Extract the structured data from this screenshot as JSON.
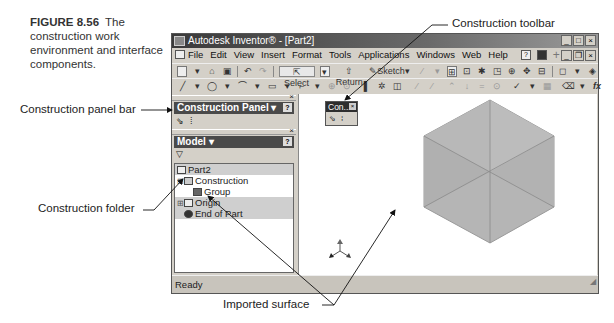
{
  "figure": {
    "number": "FIGURE 8.56",
    "caption": "The construction work environment and interface components."
  },
  "callouts": {
    "construction_toolbar": "Construction toolbar",
    "construction_panel_bar": "Construction panel bar",
    "construction_folder": "Construction folder",
    "imported_surface": "Imported surface"
  },
  "window": {
    "title": "Autodesk Inventor® - [Part2]",
    "controls": [
      "_",
      "□",
      "×"
    ],
    "doc_controls": [
      "_",
      "❐",
      "×"
    ]
  },
  "menu": {
    "items": [
      "File",
      "Edit",
      "View",
      "Insert",
      "Format",
      "Tools",
      "Applications",
      "Windows",
      "Web",
      "Help"
    ],
    "icons": [
      "help-icon",
      "camera-icon",
      "plus-icon"
    ]
  },
  "toolbar1": {
    "select_label": "Select",
    "return_label": "Return",
    "sketch_label": "Sketch"
  },
  "toolbar2": {
    "fx_label": "fx"
  },
  "construction_panel": {
    "title": "Construction Panel ▾",
    "help": "?"
  },
  "model_panel": {
    "title": "Model ▾",
    "help": "?",
    "filter_icon": "▽",
    "tree": [
      {
        "label": "Part2",
        "indent": 0,
        "shaded": true,
        "icon": "part-icon"
      },
      {
        "label": "Construction",
        "indent": 1,
        "shaded": false,
        "icon": "folder-icon",
        "expander": "⊟"
      },
      {
        "label": "Group",
        "indent": 2,
        "shaded": false,
        "icon": "group-icon"
      },
      {
        "label": "Origin",
        "indent": 1,
        "shaded": true,
        "icon": "folder-icon",
        "expander": "⊞"
      },
      {
        "label": "End of Part",
        "indent": 1,
        "shaded": true,
        "icon": "end-of-part-icon"
      }
    ]
  },
  "floating_toolbar": {
    "title": "Con...",
    "close": "×"
  },
  "status": {
    "text": "Ready"
  },
  "colors": {
    "title_bar": "#3a3a3a",
    "panel_header": "#4a4a4a",
    "surface_fill": "#b5b5b5",
    "surface_edge": "#8a8a8a"
  }
}
